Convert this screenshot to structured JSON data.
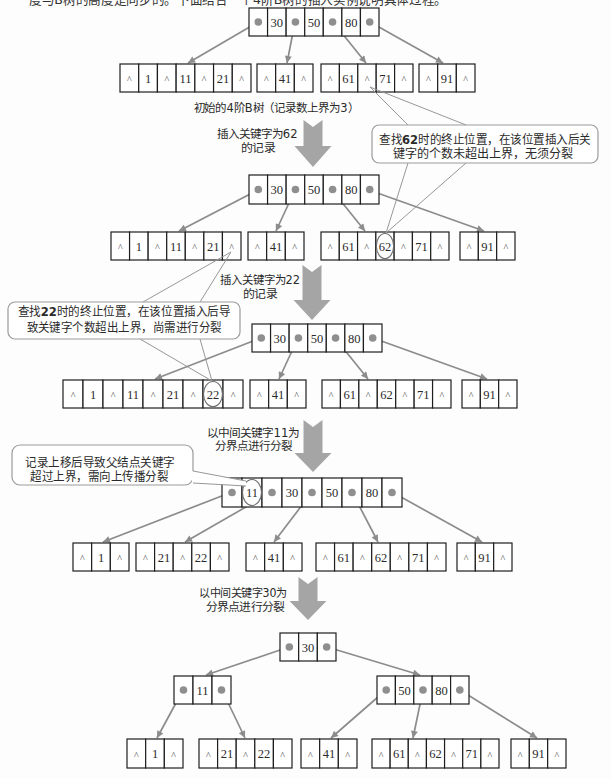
{
  "header": {
    "cropped_text": "度与B树的高度是同步的。下面结合一个4阶B树的插入实例说明具体过程。"
  },
  "diagram": {
    "stages": [
      {
        "name": "initial-tree",
        "caption": "初始的4阶B树（记录数上界为3）",
        "nodes": [
          {
            "role": "root",
            "cells": [
              "•",
              "30",
              "•",
              "50",
              "•",
              "80",
              "•"
            ]
          },
          {
            "role": "leaf",
            "cells": [
              "^",
              "1",
              "^",
              "11",
              "^",
              "21",
              "^"
            ]
          },
          {
            "role": "leaf",
            "cells": [
              "^",
              "41",
              "^"
            ]
          },
          {
            "role": "leaf",
            "cells": [
              "^",
              "61",
              "^",
              "71",
              "^"
            ]
          },
          {
            "role": "leaf",
            "cells": [
              "^",
              "91",
              "^"
            ]
          }
        ]
      },
      {
        "name": "after-insert-62",
        "nodes": [
          {
            "role": "root",
            "cells": [
              "•",
              "30",
              "•",
              "50",
              "•",
              "80",
              "•"
            ]
          },
          {
            "role": "leaf",
            "cells": [
              "^",
              "1",
              "^",
              "11",
              "^",
              "21",
              "^"
            ]
          },
          {
            "role": "leaf",
            "cells": [
              "^",
              "41",
              "^"
            ]
          },
          {
            "role": "leaf",
            "cells": [
              "^",
              "61",
              "^",
              "62",
              "^",
              "71",
              "^"
            ]
          },
          {
            "role": "leaf",
            "cells": [
              "^",
              "91",
              "^"
            ]
          }
        ],
        "highlight": {
          "node": 3,
          "cell": 3
        }
      },
      {
        "name": "after-insert-22",
        "nodes": [
          {
            "role": "root",
            "cells": [
              "•",
              "30",
              "•",
              "50",
              "•",
              "80",
              "•"
            ]
          },
          {
            "role": "leaf",
            "cells": [
              "^",
              "1",
              "^",
              "11",
              "^",
              "21",
              "^",
              "22",
              "^"
            ]
          },
          {
            "role": "leaf",
            "cells": [
              "^",
              "41",
              "^"
            ]
          },
          {
            "role": "leaf",
            "cells": [
              "^",
              "61",
              "^",
              "62",
              "^",
              "71",
              "^"
            ]
          },
          {
            "role": "leaf",
            "cells": [
              "^",
              "91",
              "^"
            ]
          }
        ],
        "highlight": {
          "node": 1,
          "cell": 7
        }
      },
      {
        "name": "split-at-11",
        "nodes": [
          {
            "role": "root",
            "cells": [
              "•",
              "11",
              "•",
              "30",
              "•",
              "50",
              "•",
              "80",
              "•"
            ]
          },
          {
            "role": "leaf",
            "cells": [
              "^",
              "1",
              "^"
            ]
          },
          {
            "role": "leaf",
            "cells": [
              "^",
              "21",
              "^",
              "22",
              "^"
            ]
          },
          {
            "role": "leaf",
            "cells": [
              "^",
              "41",
              "^"
            ]
          },
          {
            "role": "leaf",
            "cells": [
              "^",
              "61",
              "^",
              "62",
              "^",
              "71",
              "^"
            ]
          },
          {
            "role": "leaf",
            "cells": [
              "^",
              "91",
              "^"
            ]
          }
        ],
        "highlight": {
          "node": 0,
          "cell": 1
        }
      },
      {
        "name": "split-at-30",
        "nodes": [
          {
            "role": "root",
            "cells": [
              "•",
              "30",
              "•"
            ]
          },
          {
            "role": "internal",
            "cells": [
              "•",
              "11",
              "•"
            ]
          },
          {
            "role": "internal",
            "cells": [
              "•",
              "50",
              "•",
              "80",
              "•"
            ]
          },
          {
            "role": "leaf",
            "cells": [
              "^",
              "1",
              "^"
            ]
          },
          {
            "role": "leaf",
            "cells": [
              "^",
              "21",
              "^",
              "22",
              "^"
            ]
          },
          {
            "role": "leaf",
            "cells": [
              "^",
              "41",
              "^"
            ]
          },
          {
            "role": "leaf",
            "cells": [
              "^",
              "61",
              "^",
              "62",
              "^",
              "71",
              "^"
            ]
          },
          {
            "role": "leaf",
            "cells": [
              "^",
              "91",
              "^"
            ]
          }
        ]
      }
    ],
    "transitions": [
      {
        "line1": "插入关键字为62",
        "line2": "的记录"
      },
      {
        "line1": "插入关键字为22",
        "line2": "的记录"
      },
      {
        "line1": "以中间关键字11为",
        "line2": "分界点进行分裂"
      },
      {
        "line1": "以中间关键字30为",
        "line2": "分界点进行分裂"
      }
    ],
    "callouts": [
      {
        "line1_prefix": "查找",
        "line1_key": "62",
        "line1_suffix": "时的终止位置，在该位置插入后关",
        "line2": "键字的个数未超出上界，无须分裂"
      },
      {
        "line1_prefix": "查找",
        "line1_key": "22",
        "line1_suffix": "时的终止位置，在该位置插入后导",
        "line2": "致关键字个数超出上界，尚需进行分裂"
      },
      {
        "line1": "记录上移后导致父结点关键字",
        "line2": "超过上界，需向上传播分裂"
      }
    ]
  },
  "colors": {
    "node_border": "#1e1e1e",
    "connector": "#8c8c8c",
    "big_arrow": "#a5a5a5",
    "callout_border": "#9b9b9b",
    "text": "#2a2a2a",
    "background": "#fdfdfd"
  }
}
